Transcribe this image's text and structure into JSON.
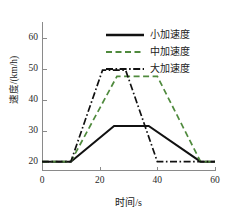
{
  "chart_data": {
    "type": "line",
    "title": "",
    "xlabel": "时间/s",
    "ylabel": "速度/(km/h)",
    "xlim": [
      0,
      60
    ],
    "ylim": [
      17,
      65
    ],
    "xticks": [
      0,
      20,
      40,
      60
    ],
    "yticks": [
      20,
      30,
      40,
      50,
      60
    ],
    "xtick_labels": [
      "0",
      "20",
      "40",
      "60"
    ],
    "ytick_labels": [
      "20",
      "30",
      "40",
      "50",
      "60"
    ],
    "grid": false,
    "legend_position": "top-right",
    "series": [
      {
        "name": "小加速度",
        "style": "solid",
        "color": "#111111",
        "x": [
          0,
          10,
          25,
          37,
          55,
          60
        ],
        "y": [
          20,
          20,
          31.5,
          31.5,
          20,
          20
        ]
      },
      {
        "name": "中加速度",
        "style": "dashed",
        "color": "#4f8a3d",
        "x": [
          0,
          10,
          26,
          40,
          55,
          60
        ],
        "y": [
          20,
          20,
          47.5,
          47.5,
          20,
          20
        ]
      },
      {
        "name": "大加速度",
        "style": "dash-dot",
        "color": "#111111",
        "x": [
          0,
          10,
          21,
          29,
          40,
          60
        ],
        "y": [
          20,
          20,
          49.5,
          49.5,
          20,
          20
        ]
      }
    ]
  },
  "legend": {
    "items": [
      {
        "label": "小加速度",
        "swatch": "legend-swatch-solid-black"
      },
      {
        "label": "中加速度",
        "swatch": "legend-swatch-dashed-green"
      },
      {
        "label": "大加速度",
        "swatch": "legend-swatch-dashdot-black"
      }
    ]
  },
  "colors": {
    "green": "#4f8a3d",
    "black": "#111111",
    "axis": "#8a8a8a",
    "background": "#ffffff"
  }
}
